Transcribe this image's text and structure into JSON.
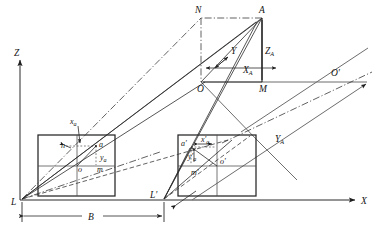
{
  "figure": {
    "type": "technical-line-diagram",
    "background_color": "#ffffff",
    "line_color": "#262626",
    "width": 381,
    "height": 234
  },
  "axes": {
    "z_label": "Z",
    "x_label": "X",
    "origin_label": "L"
  },
  "object_space": {
    "point_a": "A",
    "point_n": "N",
    "point_o": "O",
    "point_m": "M",
    "coord_x": "X",
    "coord_x_sub": "A",
    "coord_y": "Y",
    "coord_z": "Z",
    "coord_z_sub": "A",
    "coord_ya": "Y",
    "coord_ya_sub": "A"
  },
  "left_photo": {
    "perspective_center": "L",
    "principal_point": "o",
    "image_point": "a",
    "foot_x": "m",
    "foot_y": "n",
    "coord_x": "x",
    "coord_x_sub": "a",
    "coord_y": "y",
    "coord_y_sub": "a"
  },
  "right_photo": {
    "perspective_center": "L'",
    "principal_point": "o'",
    "image_point": "a'",
    "foot_x": "m'",
    "coord_x": "x'",
    "coord_x_sub": "a",
    "coord_y": "y'",
    "coord_y_sub": "a"
  },
  "right_axis_origin": {
    "label": "O'"
  },
  "baseline": {
    "label": "B"
  }
}
